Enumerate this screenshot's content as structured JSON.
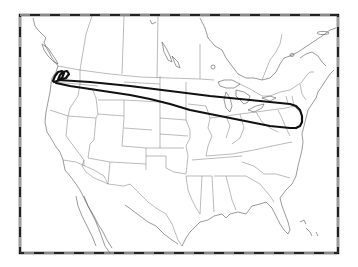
{
  "map": {
    "type": "trajectory-map",
    "region": "North America (contiguous US and southern Canada)",
    "background_color": "#ffffff",
    "linework_color": "#555555",
    "trajectory_color": "#111111",
    "frame": {
      "style": "alternating black/white dashed neatline",
      "left": 20,
      "top": 15,
      "right": 338,
      "bottom": 253
    },
    "trajectories": [
      {
        "name": "northern-track",
        "description": "From Pacific Northwest loop eastward across northern US to New England"
      },
      {
        "name": "southern-track",
        "description": "Returning from New England westward across Great Lakes to Pacific Northwest"
      }
    ],
    "loop_origin": "Pacific Northwest (Washington/Oregon coast)",
    "turnaround": "Northeastern US (New York / New Jersey area)"
  }
}
